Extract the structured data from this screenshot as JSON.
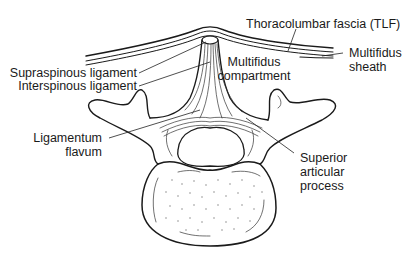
{
  "figure": {
    "background": "#ffffff",
    "line_color": "#1a1a1a"
  },
  "labels": {
    "tlf": "Thoracolumbar fascia (TLF)",
    "multifidus_sheath": [
      "Multifidus",
      "sheath"
    ],
    "multifidus_compartment": [
      "Multifidus",
      "compartment"
    ],
    "supraspinous": "Supraspinous ligament",
    "interspinous": "Interspinous ligament",
    "ligamentum_flavum": [
      "Ligamentum",
      "flavum"
    ],
    "superior_articular": [
      "Superior",
      "articular",
      "process"
    ]
  }
}
